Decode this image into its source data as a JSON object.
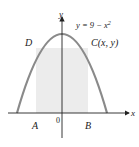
{
  "diagram": {
    "equation": "y = 9 − x²",
    "eq_main": "y = 9 − x",
    "eq_sup": "2",
    "axis_x": "x",
    "axis_y": "y",
    "origin": "0",
    "points": {
      "A": "A",
      "B": "B",
      "C": "C(x, y)",
      "D": "D"
    },
    "colors": {
      "curve": "#8a8a8a",
      "rectangle": "#ececec",
      "axes": "#222222"
    }
  }
}
